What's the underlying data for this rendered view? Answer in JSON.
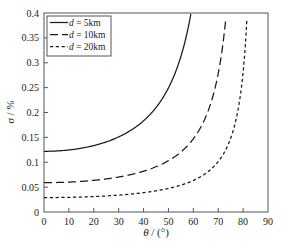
{
  "figure": {
    "background_color": "#ffffff",
    "line_color": "#1a1a1a",
    "axis_color": "#555555"
  },
  "chart_data": {
    "type": "line",
    "title": "",
    "xlabel": "θ / (°)",
    "ylabel": "σ / %",
    "xlim": [
      0,
      90
    ],
    "ylim": [
      0,
      0.4
    ],
    "grid": false,
    "legend_position": "top-left",
    "xticks": [
      0,
      10,
      20,
      30,
      40,
      50,
      60,
      70,
      80,
      90
    ],
    "xtick_labels": [
      "0",
      "10",
      "20",
      "30",
      "40",
      "50",
      "60",
      "70",
      "80",
      "90"
    ],
    "yticks": [
      0,
      0.05,
      0.1,
      0.15,
      0.2,
      0.25,
      0.3,
      0.35,
      0.4
    ],
    "ytick_labels": [
      "0",
      "0.05",
      "0.1",
      "0.15",
      "0.2",
      "0.25",
      "0.3",
      "0.35",
      "0.4"
    ],
    "x": [
      0,
      5,
      10,
      15,
      20,
      25,
      30,
      35,
      40,
      45,
      50,
      55,
      60,
      62,
      64,
      66,
      68,
      70,
      72,
      74,
      76,
      78,
      80,
      82,
      84,
      85,
      86
    ],
    "series": [
      {
        "name": "d = 5km",
        "label": "d = 5km",
        "style": "solid",
        "asymptote_deg": 72.5,
        "y0": 0.122,
        "values": [
          0.122,
          0.1225,
          0.124,
          0.126,
          0.13,
          0.135,
          0.141,
          0.15,
          0.161,
          0.176,
          0.196,
          0.224,
          0.266,
          0.29,
          0.32,
          0.36,
          0.4,
          null,
          null,
          null,
          null,
          null,
          null,
          null,
          null,
          null,
          null
        ]
      },
      {
        "name": "d = 10km",
        "label": "d = 10km",
        "style": "dashed",
        "asymptote_deg": 80.5,
        "y0": 0.059,
        "values": [
          0.059,
          0.0592,
          0.06,
          0.0605,
          0.062,
          0.064,
          0.066,
          0.069,
          0.073,
          0.079,
          0.086,
          0.096,
          0.11,
          0.118,
          0.127,
          0.139,
          0.154,
          0.175,
          0.205,
          0.25,
          0.32,
          0.4,
          null,
          null,
          null,
          null,
          null
        ]
      },
      {
        "name": "d = 20km",
        "label": "d = 20km",
        "style": "dotted",
        "asymptote_deg": 85.5,
        "y0": 0.029,
        "values": [
          0.029,
          0.0291,
          0.0295,
          0.03,
          0.0305,
          0.0315,
          0.0327,
          0.0342,
          0.0362,
          0.0389,
          0.0425,
          0.0474,
          0.0545,
          0.0585,
          0.0632,
          0.0692,
          0.0768,
          0.087,
          0.101,
          0.1215,
          0.153,
          0.206,
          0.305,
          0.4,
          null,
          null,
          null
        ]
      }
    ]
  },
  "legend": {
    "items": [
      {
        "label_var": "d",
        "label_rest": " = 5km",
        "style": "solid"
      },
      {
        "label_var": "d",
        "label_rest": " = 10km",
        "style": "dashed"
      },
      {
        "label_var": "d",
        "label_rest": " = 20km",
        "style": "dotted"
      }
    ]
  },
  "axis_titles": {
    "x_symbol": "θ",
    "x_rest": " / (°)",
    "y_symbol": "σ",
    "y_rest": " / %"
  }
}
